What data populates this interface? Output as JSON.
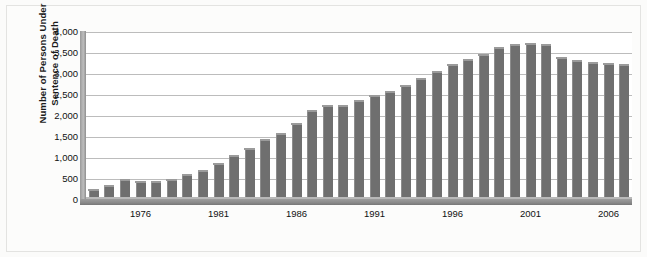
{
  "figure": {
    "axis_title_line1": "Number of Persons Under",
    "axis_title_line2": "Sentence of Death"
  },
  "chart_data": {
    "type": "bar",
    "title": "",
    "subtitle": "",
    "xlabel": "",
    "ylabel": "Number of Persons Under Sentence of Death",
    "ylim": [
      0,
      4000
    ],
    "ytick_labels": [
      "0",
      "500",
      "1,000",
      "1,500",
      "2,000",
      "2,500",
      "3,000",
      "3,500",
      "4,000"
    ],
    "ytick_values": [
      0,
      500,
      1000,
      1500,
      2000,
      2500,
      3000,
      3500,
      4000
    ],
    "xtick_labels": [
      "1976",
      "1981",
      "1986",
      "1991",
      "1996",
      "2001",
      "2006"
    ],
    "xtick_values": [
      1976,
      1981,
      1986,
      1991,
      1996,
      2001,
      2006
    ],
    "grid": true,
    "legend": "none",
    "bar_color": "#6f6f6f",
    "categories": [
      1973,
      1974,
      1975,
      1976,
      1977,
      1978,
      1979,
      1980,
      1981,
      1982,
      1983,
      1984,
      1985,
      1986,
      1987,
      1988,
      1989,
      1990,
      1991,
      1992,
      1993,
      1994,
      1995,
      1996,
      1997,
      1998,
      1999,
      2000,
      2001,
      2002,
      2003,
      2004,
      2005,
      2006,
      2007
    ],
    "values": [
      231,
      335,
      488,
      420,
      423,
      482,
      593,
      697,
      856,
      1050,
      1209,
      1420,
      1575,
      1800,
      2124,
      2245,
      2250,
      2356,
      2482,
      2575,
      2716,
      2890,
      3054,
      3219,
      3335,
      3452,
      3625,
      3682,
      3711,
      3697,
      3374,
      3315,
      3254,
      3228,
      3220
    ]
  }
}
